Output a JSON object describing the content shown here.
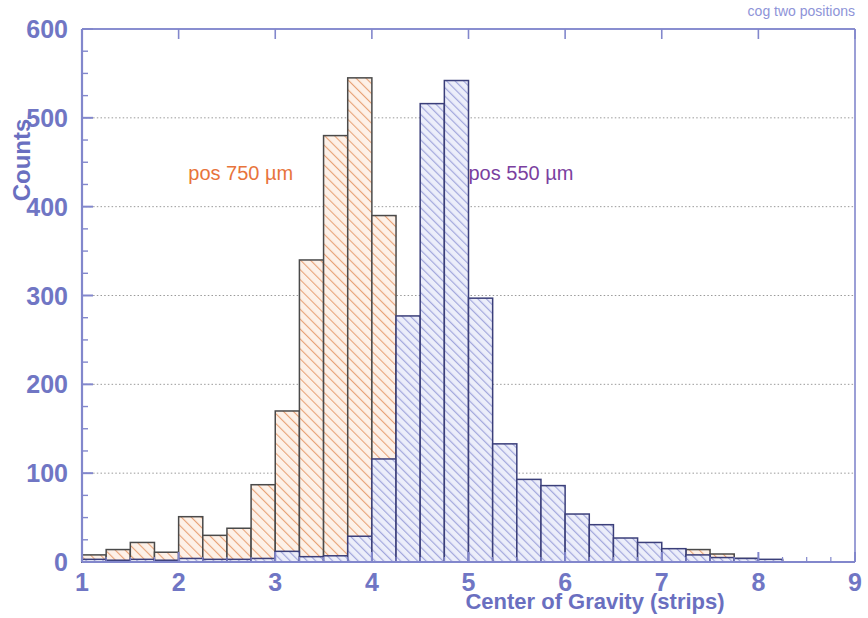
{
  "chart_data": {
    "type": "bar",
    "title": "cog two positions",
    "xlabel": "Center of Gravity (strips)",
    "ylabel": "Counts",
    "xlim": [
      1,
      9
    ],
    "ylim": [
      0,
      600
    ],
    "xticks": [
      "1",
      "2",
      "3",
      "4",
      "5",
      "6",
      "7",
      "8",
      "9"
    ],
    "yticks": [
      "0",
      "100",
      "200",
      "300",
      "400",
      "500",
      "600"
    ],
    "grid": "horizontal dotted gridlines at every 100 counts",
    "legend_position": "inline annotations on plot",
    "bin_width": 0.25,
    "annotations": [
      {
        "text": "pos 750 µm",
        "color": "#e8743b",
        "x": 2.1,
        "y": 430
      },
      {
        "text": "pos 550 µm",
        "color": "#7b3fa0",
        "x": 5.0,
        "y": 430
      }
    ],
    "series": [
      {
        "name": "pos 750 µm",
        "color": "#e8743b",
        "fill": "#f7ddcb",
        "hatch": "/",
        "x": [
          1.0,
          1.25,
          1.5,
          1.75,
          2.0,
          2.25,
          2.5,
          2.75,
          3.0,
          3.25,
          3.5,
          3.75,
          4.0,
          4.25,
          4.5,
          4.75,
          5.0,
          5.25,
          5.5,
          5.75,
          6.0,
          6.25,
          6.5,
          6.75,
          7.0,
          7.25,
          7.5,
          7.75,
          8.0
        ],
        "values": [
          8,
          14,
          22,
          11,
          51,
          30,
          38,
          87,
          170,
          340,
          480,
          545,
          390,
          232,
          116,
          0,
          0,
          0,
          0,
          0,
          0,
          0,
          10,
          6,
          14,
          14,
          9,
          4,
          2
        ]
      },
      {
        "name": "pos 550 µm",
        "color": "#5a5fae",
        "fill": "#c3c6e8",
        "hatch": "/",
        "x": [
          1.0,
          1.25,
          1.5,
          1.75,
          2.0,
          2.25,
          2.5,
          2.75,
          3.0,
          3.25,
          3.5,
          3.75,
          4.0,
          4.25,
          4.5,
          4.75,
          5.0,
          5.25,
          5.5,
          5.75,
          6.0,
          6.25,
          6.5,
          6.75,
          7.0,
          7.25,
          7.5,
          7.75,
          8.0
        ],
        "values": [
          3,
          2,
          3,
          2,
          4,
          3,
          3,
          4,
          12,
          6,
          7,
          29,
          116,
          277,
          516,
          542,
          297,
          133,
          93,
          86,
          54,
          42,
          27,
          22,
          15,
          8,
          5,
          4,
          3
        ]
      }
    ]
  },
  "geometry": {
    "plot_left": 82,
    "plot_right": 855,
    "plot_top": 29,
    "plot_bottom": 562
  },
  "colors": {
    "axis": "#8287cc",
    "tick_text": "#7076c4",
    "grid": "#9a9a9a",
    "title": "#8e93d8",
    "orange": "#e8743b",
    "orange_fill": "#f7ddcb",
    "blue": "#5a5fae",
    "blue_fill": "#c3c6e8",
    "purple_text": "#7b3fa0",
    "background": "#ffffff"
  }
}
